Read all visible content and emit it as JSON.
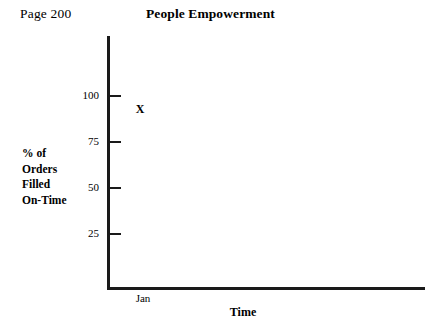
{
  "header": {
    "page_number": "Page 200",
    "title": "People Empowerment"
  },
  "chart_data": {
    "type": "scatter",
    "title": "People Empowerment",
    "xlabel": "Time",
    "ylabel": "% of Orders Filled On-Time",
    "ylabel_lines": [
      "% of",
      "Orders",
      "Filled",
      "On-Time"
    ],
    "categories": [
      "Jan"
    ],
    "x": [
      "Jan"
    ],
    "values": [
      93
    ],
    "series": [
      {
        "name": "% of Orders Filled On-Time",
        "marker": "X",
        "points": [
          {
            "x": "Jan",
            "y": 93,
            "label": "X"
          }
        ]
      }
    ],
    "yticks": [
      100,
      75,
      50,
      25
    ],
    "ytick_labels": [
      "100",
      "75",
      "50",
      "25"
    ],
    "xtick_labels": [
      "Jan"
    ],
    "ylim": [
      0,
      112
    ],
    "grid": false,
    "legend": false,
    "axis_color": "#1a1a1a",
    "background_color": "#ffffff"
  }
}
